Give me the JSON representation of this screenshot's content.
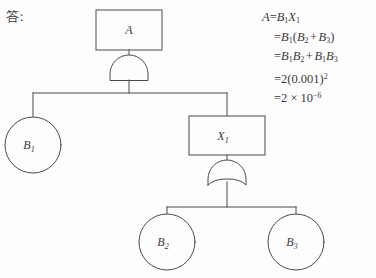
{
  "page": {
    "answer_label": "答:",
    "background_color": "#fdfdfd",
    "line_color": "#4a4a4a"
  },
  "diagram": {
    "type": "fault-tree",
    "nodes": [
      {
        "id": "A",
        "shape": "rect",
        "label": "A",
        "sub": "",
        "cx": 129,
        "cy": 30,
        "w": 66,
        "h": 40
      },
      {
        "id": "X1",
        "shape": "rect",
        "label": "X",
        "sub": "1",
        "cx": 227,
        "cy": 136,
        "w": 76,
        "h": 39
      },
      {
        "id": "B1",
        "shape": "circle",
        "label": "B",
        "sub": "1",
        "cx": 33,
        "cy": 145,
        "r": 28
      },
      {
        "id": "B2",
        "shape": "circle",
        "label": "B",
        "sub": "2",
        "cx": 167,
        "cy": 242,
        "r": 28
      },
      {
        "id": "B3",
        "shape": "circle",
        "label": "B",
        "sub": "3",
        "cx": 296,
        "cy": 242,
        "r": 28
      }
    ],
    "gates": [
      {
        "id": "G1",
        "kind": "and-gate",
        "cx": 129,
        "cy": 72,
        "parent": "A",
        "children": [
          "B1",
          "X1"
        ]
      },
      {
        "id": "G2",
        "kind": "or-gate",
        "cx": 227,
        "cy": 177,
        "parent": "X1",
        "children": [
          "B2",
          "B3"
        ]
      }
    ]
  },
  "equations": {
    "lines": [
      {
        "lhs": "A",
        "rhs": "=B₁X₁"
      },
      {
        "lhs": "",
        "rhs": "=B₁(B₂ + B₃)"
      },
      {
        "lhs": "",
        "rhs": "=B₁B₂ + B₁B₃"
      },
      {
        "lhs": "",
        "rhs": "=2(0.001)²"
      },
      {
        "lhs": "",
        "rhs": "=2 × 10⁻⁶"
      }
    ],
    "line1_var": "A",
    "line1_eq": "=",
    "line1_b": "B",
    "line1_b_sub": "1",
    "line1_x": "X",
    "line1_x_sub": "1",
    "line2_eq": "=",
    "line2_b": "B",
    "line2_b_sub": "1",
    "line2_open": "(",
    "line2_b2": "B",
    "line2_b2_sub": "2",
    "line2_plus": "+",
    "line2_b3": "B",
    "line2_b3_sub": "3",
    "line2_close": ")",
    "line3_eq": "=",
    "line3_a1": "B",
    "line3_a1_sub": "1",
    "line3_a2": "B",
    "line3_a2_sub": "2",
    "line3_plus": "+",
    "line3_b1": "B",
    "line3_b1_sub": "1",
    "line3_b2": "B",
    "line3_b2_sub": "3",
    "line4_text": "=2(0.001)",
    "line4_sup": "2",
    "line5_text": "=2 × 10",
    "line5_sup": "−6"
  }
}
